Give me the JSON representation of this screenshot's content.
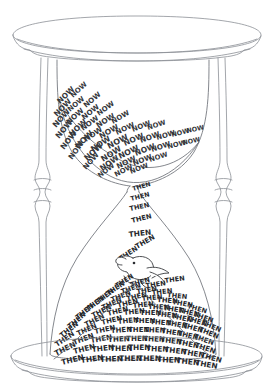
{
  "artwork": {
    "title": "Hourglass of NOW and THEN",
    "medium": "pen-and-ink line drawing",
    "background_color": "#ffffff",
    "line_color": "#8c8f96",
    "text_color": "#2b2d31"
  },
  "words": {
    "upper_label": "NOW",
    "lower_label": "THEN"
  },
  "frame": {
    "top_cap_name": "top-cap",
    "base_name": "base-plate",
    "left_post_name": "left-post",
    "right_post_name": "right-post"
  },
  "bulbs": {
    "upper_name": "upper-bulb",
    "lower_name": "lower-bulb",
    "neck_name": "neck"
  },
  "creature": {
    "name": "bird",
    "description": "small bird catching falling words"
  },
  "now_cloud": [
    {
      "x": 60,
      "y": 104,
      "r": -44,
      "s": 7.4
    },
    {
      "x": 73,
      "y": 98,
      "r": -42,
      "s": 7.0
    },
    {
      "x": 86,
      "y": 108,
      "r": -40,
      "s": 7.2
    },
    {
      "x": 57,
      "y": 117,
      "r": -46,
      "s": 7.6
    },
    {
      "x": 70,
      "y": 112,
      "r": -40,
      "s": 7.0
    },
    {
      "x": 84,
      "y": 120,
      "r": -38,
      "s": 7.2
    },
    {
      "x": 99,
      "y": 116,
      "r": -36,
      "s": 7.0
    },
    {
      "x": 56,
      "y": 128,
      "r": -48,
      "s": 7.8
    },
    {
      "x": 69,
      "y": 125,
      "r": -42,
      "s": 7.4
    },
    {
      "x": 83,
      "y": 131,
      "r": -36,
      "s": 7.2
    },
    {
      "x": 98,
      "y": 128,
      "r": -32,
      "s": 7.4
    },
    {
      "x": 113,
      "y": 124,
      "r": -30,
      "s": 7.0
    },
    {
      "x": 59,
      "y": 139,
      "r": -50,
      "s": 7.8
    },
    {
      "x": 72,
      "y": 137,
      "r": -44,
      "s": 7.6
    },
    {
      "x": 86,
      "y": 142,
      "r": -34,
      "s": 7.4
    },
    {
      "x": 101,
      "y": 139,
      "r": -30,
      "s": 7.6
    },
    {
      "x": 117,
      "y": 135,
      "r": -26,
      "s": 7.2
    },
    {
      "x": 133,
      "y": 132,
      "r": -22,
      "s": 7.0
    },
    {
      "x": 148,
      "y": 130,
      "r": -18,
      "s": 6.8
    },
    {
      "x": 64,
      "y": 150,
      "r": -52,
      "s": 7.6
    },
    {
      "x": 78,
      "y": 149,
      "r": -44,
      "s": 7.8
    },
    {
      "x": 93,
      "y": 152,
      "r": -34,
      "s": 7.8
    },
    {
      "x": 109,
      "y": 149,
      "r": -28,
      "s": 8.0
    },
    {
      "x": 125,
      "y": 146,
      "r": -24,
      "s": 7.6
    },
    {
      "x": 141,
      "y": 143,
      "r": -20,
      "s": 7.4
    },
    {
      "x": 157,
      "y": 140,
      "r": -16,
      "s": 7.0
    },
    {
      "x": 172,
      "y": 137,
      "r": -14,
      "s": 6.6
    },
    {
      "x": 187,
      "y": 133,
      "r": -12,
      "s": 6.4
    },
    {
      "x": 72,
      "y": 160,
      "r": -54,
      "s": 7.4
    },
    {
      "x": 87,
      "y": 161,
      "r": -42,
      "s": 7.8
    },
    {
      "x": 103,
      "y": 162,
      "r": -32,
      "s": 8.0
    },
    {
      "x": 120,
      "y": 159,
      "r": -26,
      "s": 7.8
    },
    {
      "x": 136,
      "y": 156,
      "r": -22,
      "s": 7.6
    },
    {
      "x": 152,
      "y": 152,
      "r": -18,
      "s": 7.2
    },
    {
      "x": 168,
      "y": 149,
      "r": -14,
      "s": 6.8
    },
    {
      "x": 183,
      "y": 145,
      "r": -12,
      "s": 6.4
    },
    {
      "x": 86,
      "y": 170,
      "r": -48,
      "s": 7.2
    },
    {
      "x": 102,
      "y": 171,
      "r": -34,
      "s": 7.6
    },
    {
      "x": 118,
      "y": 169,
      "r": -26,
      "s": 7.4
    },
    {
      "x": 134,
      "y": 166,
      "r": -22,
      "s": 7.2
    },
    {
      "x": 150,
      "y": 162,
      "r": -18,
      "s": 6.8
    },
    {
      "x": 100,
      "y": 178,
      "r": -38,
      "s": 6.8
    },
    {
      "x": 116,
      "y": 177,
      "r": -28,
      "s": 7.0
    },
    {
      "x": 131,
      "y": 174,
      "r": -22,
      "s": 6.8
    }
  ],
  "fall_stream": [
    {
      "x": 133,
      "y": 191,
      "r": -16,
      "s": 6.2
    },
    {
      "x": 131,
      "y": 201,
      "r": -14,
      "s": 6.4
    },
    {
      "x": 130,
      "y": 211,
      "r": -12,
      "s": 6.6
    },
    {
      "x": 132,
      "y": 223,
      "r": -14,
      "s": 6.8
    },
    {
      "x": 129,
      "y": 237,
      "r": -6,
      "s": 7.4
    },
    {
      "x": 137,
      "y": 249,
      "r": -30,
      "s": 7.0
    },
    {
      "x": 121,
      "y": 261,
      "r": -34,
      "s": 6.8
    },
    {
      "x": 165,
      "y": 283,
      "r": -8,
      "s": 6.6
    }
  ],
  "then_pile": [
    {
      "x": 117,
      "y": 288,
      "r": -32,
      "s": 6.6
    },
    {
      "x": 131,
      "y": 287,
      "r": -16,
      "s": 6.6
    },
    {
      "x": 146,
      "y": 288,
      "r": -8,
      "s": 6.6
    },
    {
      "x": 108,
      "y": 296,
      "r": -34,
      "s": 6.8
    },
    {
      "x": 122,
      "y": 294,
      "r": -20,
      "s": 6.8
    },
    {
      "x": 137,
      "y": 294,
      "r": -10,
      "s": 6.8
    },
    {
      "x": 152,
      "y": 295,
      "r": -6,
      "s": 6.8
    },
    {
      "x": 167,
      "y": 297,
      "r": 6,
      "s": 6.6
    },
    {
      "x": 98,
      "y": 304,
      "r": -36,
      "s": 6.8
    },
    {
      "x": 112,
      "y": 302,
      "r": -22,
      "s": 6.8
    },
    {
      "x": 127,
      "y": 301,
      "r": -12,
      "s": 6.8
    },
    {
      "x": 142,
      "y": 301,
      "r": -6,
      "s": 6.8
    },
    {
      "x": 157,
      "y": 302,
      "r": 4,
      "s": 6.8
    },
    {
      "x": 172,
      "y": 304,
      "r": 10,
      "s": 6.8
    },
    {
      "x": 187,
      "y": 308,
      "r": 16,
      "s": 6.6
    },
    {
      "x": 88,
      "y": 312,
      "r": -38,
      "s": 7.0
    },
    {
      "x": 103,
      "y": 310,
      "r": -24,
      "s": 7.0
    },
    {
      "x": 118,
      "y": 308,
      "r": -14,
      "s": 7.0
    },
    {
      "x": 133,
      "y": 308,
      "r": -6,
      "s": 7.0
    },
    {
      "x": 148,
      "y": 309,
      "r": 2,
      "s": 7.0
    },
    {
      "x": 163,
      "y": 310,
      "r": 8,
      "s": 7.0
    },
    {
      "x": 178,
      "y": 312,
      "r": 14,
      "s": 7.0
    },
    {
      "x": 193,
      "y": 316,
      "r": 20,
      "s": 6.8
    },
    {
      "x": 78,
      "y": 320,
      "r": -40,
      "s": 7.0
    },
    {
      "x": 93,
      "y": 318,
      "r": -26,
      "s": 7.0
    },
    {
      "x": 108,
      "y": 316,
      "r": -14,
      "s": 7.0
    },
    {
      "x": 124,
      "y": 315,
      "r": -6,
      "s": 7.0
    },
    {
      "x": 140,
      "y": 315,
      "r": 0,
      "s": 7.0
    },
    {
      "x": 156,
      "y": 316,
      "r": 6,
      "s": 7.0
    },
    {
      "x": 171,
      "y": 318,
      "r": 12,
      "s": 7.0
    },
    {
      "x": 186,
      "y": 320,
      "r": 18,
      "s": 7.0
    },
    {
      "x": 201,
      "y": 324,
      "r": 24,
      "s": 6.8
    },
    {
      "x": 70,
      "y": 329,
      "r": -40,
      "s": 7.0
    },
    {
      "x": 86,
      "y": 327,
      "r": -26,
      "s": 7.0
    },
    {
      "x": 102,
      "y": 325,
      "r": -14,
      "s": 7.0
    },
    {
      "x": 118,
      "y": 324,
      "r": -6,
      "s": 7.0
    },
    {
      "x": 134,
      "y": 323,
      "r": 0,
      "s": 7.0
    },
    {
      "x": 150,
      "y": 324,
      "r": 4,
      "s": 7.0
    },
    {
      "x": 166,
      "y": 325,
      "r": 10,
      "s": 7.0
    },
    {
      "x": 182,
      "y": 327,
      "r": 16,
      "s": 7.0
    },
    {
      "x": 198,
      "y": 331,
      "r": 22,
      "s": 7.0
    },
    {
      "x": 62,
      "y": 338,
      "r": -38,
      "s": 7.0
    },
    {
      "x": 78,
      "y": 336,
      "r": -24,
      "s": 7.0
    },
    {
      "x": 95,
      "y": 334,
      "r": -12,
      "s": 7.0
    },
    {
      "x": 111,
      "y": 333,
      "r": -4,
      "s": 7.0
    },
    {
      "x": 128,
      "y": 332,
      "r": 0,
      "s": 7.0
    },
    {
      "x": 144,
      "y": 332,
      "r": 2,
      "s": 7.0
    },
    {
      "x": 161,
      "y": 333,
      "r": 8,
      "s": 7.0
    },
    {
      "x": 177,
      "y": 335,
      "r": 14,
      "s": 7.0
    },
    {
      "x": 193,
      "y": 338,
      "r": 20,
      "s": 7.0
    },
    {
      "x": 57,
      "y": 347,
      "r": -34,
      "s": 7.2
    },
    {
      "x": 74,
      "y": 345,
      "r": -20,
      "s": 7.2
    },
    {
      "x": 91,
      "y": 343,
      "r": -10,
      "s": 7.2
    },
    {
      "x": 108,
      "y": 342,
      "r": -2,
      "s": 7.2
    },
    {
      "x": 126,
      "y": 341,
      "r": 0,
      "s": 7.2
    },
    {
      "x": 143,
      "y": 341,
      "r": 2,
      "s": 7.2
    },
    {
      "x": 160,
      "y": 342,
      "r": 6,
      "s": 7.2
    },
    {
      "x": 177,
      "y": 344,
      "r": 12,
      "s": 7.2
    },
    {
      "x": 194,
      "y": 347,
      "r": 18,
      "s": 7.2
    },
    {
      "x": 56,
      "y": 356,
      "r": -26,
      "s": 7.4
    },
    {
      "x": 74,
      "y": 354,
      "r": -14,
      "s": 7.4
    },
    {
      "x": 92,
      "y": 352,
      "r": -6,
      "s": 7.4
    },
    {
      "x": 110,
      "y": 351,
      "r": 0,
      "s": 7.4
    },
    {
      "x": 128,
      "y": 350,
      "r": 0,
      "s": 7.4
    },
    {
      "x": 146,
      "y": 351,
      "r": 2,
      "s": 7.4
    },
    {
      "x": 164,
      "y": 352,
      "r": 6,
      "s": 7.4
    },
    {
      "x": 182,
      "y": 354,
      "r": 10,
      "s": 7.4
    },
    {
      "x": 200,
      "y": 357,
      "r": 16,
      "s": 7.2
    },
    {
      "x": 62,
      "y": 365,
      "r": -14,
      "s": 7.6
    },
    {
      "x": 81,
      "y": 363,
      "r": -8,
      "s": 7.6
    },
    {
      "x": 100,
      "y": 362,
      "r": -2,
      "s": 7.6
    },
    {
      "x": 119,
      "y": 361,
      "r": 0,
      "s": 7.6
    },
    {
      "x": 138,
      "y": 361,
      "r": 0,
      "s": 7.6
    },
    {
      "x": 157,
      "y": 362,
      "r": 2,
      "s": 7.6
    },
    {
      "x": 176,
      "y": 363,
      "r": 6,
      "s": 7.6
    },
    {
      "x": 195,
      "y": 365,
      "r": 10,
      "s": 7.4
    }
  ]
}
